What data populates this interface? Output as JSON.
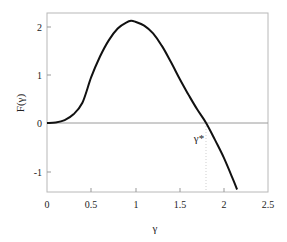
{
  "chart_data": {
    "type": "line",
    "title": "",
    "xlabel": "γ",
    "ylabel": "F(γ)",
    "xlim": [
      0,
      2.5
    ],
    "ylim": [
      -1.4,
      2.3
    ],
    "x_ticks": [
      "0",
      "0.5",
      "1",
      "1.5",
      "2",
      "2.5"
    ],
    "y_ticks": [
      "2",
      "1",
      "0",
      "-1"
    ],
    "grid": false,
    "legend": null,
    "annotations": [
      {
        "text": "γ*",
        "x": 1.8,
        "y": -0.2,
        "note": "zero crossing marked with dotted vertical line"
      }
    ],
    "reference_lines": [
      {
        "type": "horizontal",
        "y": 0
      },
      {
        "type": "vertical-dotted",
        "x": 1.8
      }
    ],
    "series": [
      {
        "name": "F(γ)",
        "x": [
          0,
          0.1,
          0.2,
          0.3,
          0.4,
          0.5,
          0.6,
          0.7,
          0.8,
          0.9,
          0.95,
          1.0,
          1.1,
          1.2,
          1.3,
          1.4,
          1.5,
          1.6,
          1.7,
          1.8,
          1.9,
          2.0,
          2.1,
          2.15
        ],
        "y": [
          0,
          0.01,
          0.06,
          0.18,
          0.42,
          0.95,
          1.38,
          1.72,
          1.96,
          2.09,
          2.12,
          2.1,
          2.02,
          1.86,
          1.6,
          1.27,
          0.92,
          0.59,
          0.28,
          0.0,
          -0.35,
          -0.72,
          -1.15,
          -1.38
        ]
      }
    ]
  }
}
